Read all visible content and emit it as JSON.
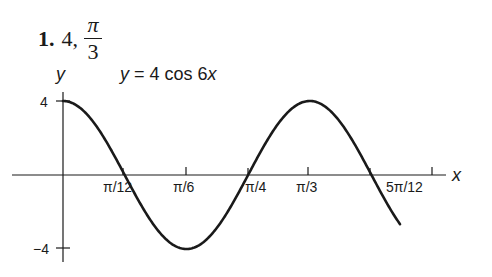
{
  "problem": {
    "number": "1.",
    "amplitude": "4,",
    "period_numerator": "π",
    "period_denominator": "3"
  },
  "chart_data": {
    "type": "line",
    "title": "y = 4 cos 6x",
    "xlabel": "x",
    "ylabel": "y",
    "function": "4*cos(6*x)",
    "x_ticks": [
      "π/12",
      "π/6",
      "π/4",
      "π/3",
      "5π/12"
    ],
    "x_tick_values": [
      0.2618,
      0.5236,
      0.7854,
      1.0472,
      1.309
    ],
    "y_ticks": [
      "4",
      "−4"
    ],
    "y_tick_values": [
      4,
      -4
    ],
    "xlim": [
      0,
      1.43
    ],
    "ylim": [
      -4,
      4
    ],
    "grid": false,
    "points": [
      {
        "x": 0,
        "y": 4
      },
      {
        "x": 0.2618,
        "y": 0
      },
      {
        "x": 0.5236,
        "y": -4
      },
      {
        "x": 0.7854,
        "y": 0
      },
      {
        "x": 1.0472,
        "y": 4
      },
      {
        "x": 1.309,
        "y": 0
      },
      {
        "x": 1.43,
        "y": -2.4
      }
    ],
    "color": "#1a1a1a"
  }
}
